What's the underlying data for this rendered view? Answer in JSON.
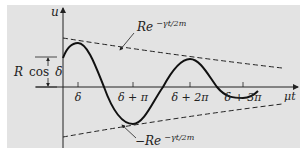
{
  "figure": {
    "y_axis_label": "u",
    "x_axis_label": "μt",
    "amplitude_label": {
      "R": "R",
      "cos": "cos",
      "delta": "δ"
    },
    "upper_envelope_label": {
      "base": "Re",
      "exponent": "−γt/2m"
    },
    "lower_envelope_label": {
      "base": "−Re",
      "exponent": "−γt/2m"
    },
    "ticks": [
      {
        "label": "δ",
        "x": 78
      },
      {
        "label": "δ + π",
        "x": 133
      },
      {
        "label": "δ + 2π",
        "x": 190
      },
      {
        "label": "δ + 3π",
        "x": 243
      }
    ],
    "colors": {
      "background": "#e3e3e3",
      "ink": "#222222"
    }
  }
}
